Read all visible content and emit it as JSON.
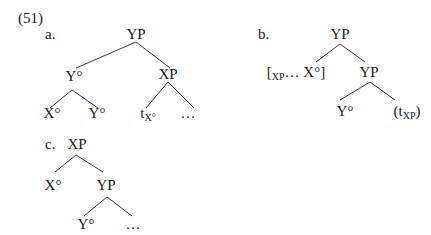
{
  "example_number": "(51)",
  "trees": {
    "a": {
      "label": "a.",
      "root": "YP",
      "left": "Y°",
      "right": "XP",
      "left_left": "X°",
      "left_right": "Y°",
      "right_left_base": "t",
      "right_left_sub": "X°",
      "right_right": "…"
    },
    "b": {
      "label": "b.",
      "root": "YP",
      "left_open": "[",
      "left_sub": "XP",
      "left_rest": "… X°]",
      "right": "YP",
      "right_left": "Y°",
      "right_right_open": "(t",
      "right_right_sub": "XP",
      "right_right_close": ")"
    },
    "c": {
      "label": "c.",
      "root": "XP",
      "left": "X°",
      "right": "YP",
      "right_left": "Y°",
      "right_right": "…"
    }
  }
}
